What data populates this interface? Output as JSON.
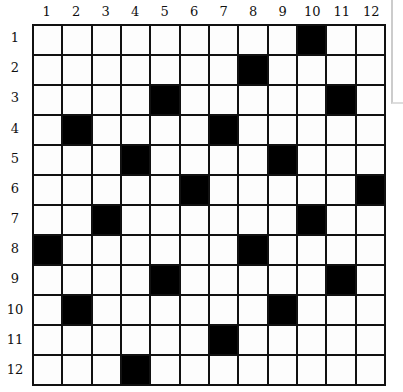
{
  "puzzle": {
    "rows": 12,
    "cols": 12,
    "column_labels": [
      "1",
      "2",
      "3",
      "4",
      "5",
      "6",
      "7",
      "8",
      "9",
      "10",
      "11",
      "12"
    ],
    "row_labels": [
      "1",
      "2",
      "3",
      "4",
      "5",
      "6",
      "7",
      "8",
      "9",
      "10",
      "11",
      "12"
    ],
    "black_cells": [
      [
        1,
        10
      ],
      [
        2,
        8
      ],
      [
        3,
        5
      ],
      [
        3,
        11
      ],
      [
        4,
        2
      ],
      [
        4,
        7
      ],
      [
        5,
        4
      ],
      [
        5,
        9
      ],
      [
        6,
        6
      ],
      [
        6,
        12
      ],
      [
        7,
        3
      ],
      [
        7,
        10
      ],
      [
        8,
        1
      ],
      [
        8,
        8
      ],
      [
        9,
        5
      ],
      [
        9,
        11
      ],
      [
        10,
        2
      ],
      [
        10,
        9
      ],
      [
        11,
        7
      ],
      [
        12,
        4
      ]
    ],
    "colors": {
      "black": "#000000",
      "white": "#fdfdfd",
      "line": "#111111"
    }
  }
}
